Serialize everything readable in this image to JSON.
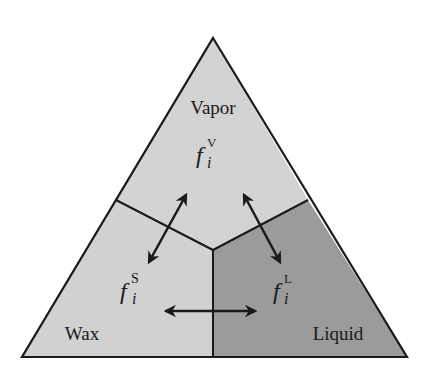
{
  "diagram": {
    "type": "ternary-phase-equilibrium",
    "regions": [
      {
        "id": "vapor",
        "label": "Vapor",
        "fugacity_base": "f",
        "fugacity_sub": "i",
        "fugacity_sup": "V",
        "fill": "#d3d3d3"
      },
      {
        "id": "wax",
        "label": "Wax",
        "fugacity_base": "f",
        "fugacity_sub": "i",
        "fugacity_sup": "S",
        "fill": "#d3d3d3"
      },
      {
        "id": "liquid",
        "label": "Liquid",
        "fugacity_base": "f",
        "fugacity_sub": "i",
        "fugacity_sup": "L",
        "fill": "#9b9b9b"
      }
    ],
    "equilibria": [
      {
        "from": "vapor",
        "to": "wax",
        "arrow": "double"
      },
      {
        "from": "vapor",
        "to": "liquid",
        "arrow": "double"
      },
      {
        "from": "wax",
        "to": "liquid",
        "arrow": "double"
      }
    ],
    "colors": {
      "outline": "#1a1a1a",
      "light_fill": "#d3d3d3",
      "dark_fill": "#9b9b9b",
      "background": "#ffffff"
    }
  }
}
